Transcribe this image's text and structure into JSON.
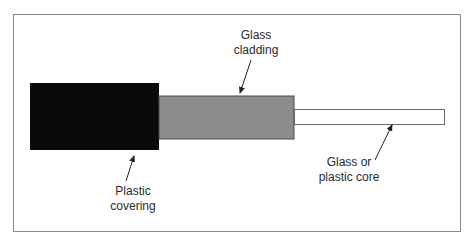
{
  "diagram": {
    "colors": {
      "frame": "#8a8a8a",
      "covering": "#0a0a0a",
      "cladding": "#8c8c8c",
      "cladding_edge": "#4a4a4a",
      "core": "#ffffff",
      "core_edge": "#666666",
      "arrow": "#222222",
      "text": "#2a2a2a"
    },
    "labels": {
      "cladding": {
        "line1": "Glass",
        "line2": "cladding"
      },
      "covering": {
        "line1": "Plastic",
        "line2": "covering"
      },
      "core": {
        "line1": "Glass or",
        "line2": "plastic core"
      }
    }
  }
}
